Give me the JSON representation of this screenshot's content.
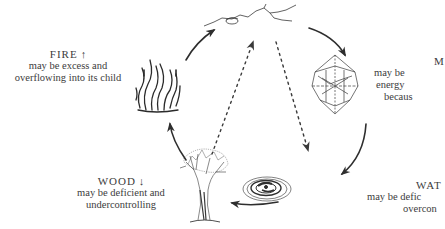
{
  "diagram": {
    "type": "five-element-cycle",
    "elements": [
      {
        "id": "earth",
        "icon": "mountain-icon",
        "position": "top",
        "label": null
      },
      {
        "id": "metal",
        "icon": "crystal-icon",
        "position": "right",
        "title": "M",
        "lines": [
          "may be",
          "energy",
          "becaus"
        ]
      },
      {
        "id": "water",
        "icon": "water-ripple-icon",
        "position": "bottom-right",
        "title": "WAT",
        "lines": [
          "may be defic",
          "overcon"
        ]
      },
      {
        "id": "wood",
        "icon": "tree-icon",
        "position": "bottom-left",
        "title": "WOOD",
        "arrow": "↓",
        "lines": [
          "may be deficient and",
          "undercontrolling"
        ]
      },
      {
        "id": "fire",
        "icon": "flame-icon",
        "position": "left",
        "title": "FIRE",
        "arrow": "↑",
        "lines": [
          "may be excess and",
          "overflowing into its child"
        ]
      }
    ],
    "arrows": [
      {
        "from": "fire",
        "to": "earth",
        "style": "solid"
      },
      {
        "from": "earth",
        "to": "metal",
        "style": "solid"
      },
      {
        "from": "metal",
        "to": "water",
        "style": "solid"
      },
      {
        "from": "water",
        "to": "wood",
        "style": "solid"
      },
      {
        "from": "wood",
        "to": "fire",
        "style": "solid"
      },
      {
        "from": "wood",
        "to": "earth",
        "style": "dotted"
      },
      {
        "from": "earth",
        "to": "water",
        "style": "dotted"
      }
    ],
    "colors": {
      "ink": "#333333",
      "text": "#3c3c3c",
      "background": "#ffffff"
    }
  },
  "labels": {
    "fire": {
      "title": "FIRE",
      "arrow": "↑",
      "line1": "may be excess and",
      "line2": "overflowing into its child"
    },
    "wood": {
      "title": "WOOD",
      "arrow": "↓",
      "line1": "may be deficient and",
      "line2": "undercontrolling"
    },
    "metal": {
      "title": "M",
      "line1": "may be",
      "line2": "energy",
      "line3": "becaus"
    },
    "water": {
      "title": "WAT",
      "line1": "may be defic",
      "line2": "overcon"
    }
  }
}
